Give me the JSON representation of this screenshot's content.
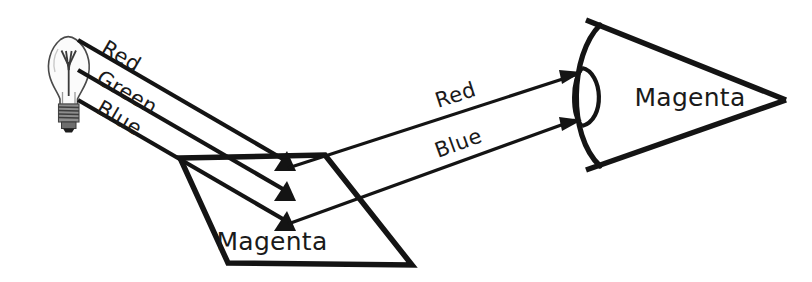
{
  "diagram": {
    "background_color": "#ffffff",
    "ink_color": "#141414",
    "source": {
      "icon": "light-bulb-icon",
      "description": "Incandescent light bulb emitting white light"
    },
    "incident_beams": [
      {
        "id": "red",
        "label": "Red"
      },
      {
        "id": "green",
        "label": "Green"
      },
      {
        "id": "blue",
        "label": "Blue"
      }
    ],
    "surface": {
      "label": "Magenta",
      "shape": "parallelogram"
    },
    "reflected_beams": [
      {
        "id": "red-reflected",
        "label": "Red"
      },
      {
        "id": "blue-reflected",
        "label": "Blue"
      }
    ],
    "observer": {
      "icon": "eye-icon",
      "label": "Magenta",
      "description": "Eye perceiving magenta"
    }
  }
}
